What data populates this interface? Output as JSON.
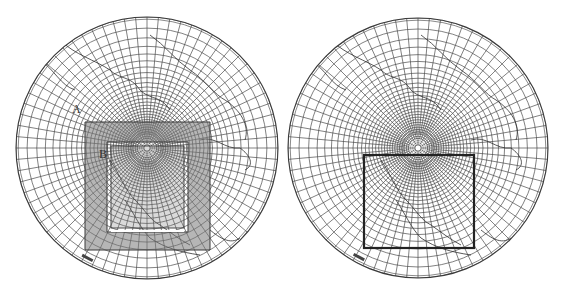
{
  "figure": {
    "panels": [
      {
        "id": "left",
        "projection": "polar-stereographic",
        "center": [
          147,
          148
        ],
        "radius": 131,
        "domain_style": "nested-shaded-frame",
        "outer_box": [
          85,
          122,
          210,
          250
        ],
        "inner_box": [
          107,
          142,
          188,
          232
        ],
        "labels": [
          {
            "text": "A",
            "x": 72,
            "y": 113
          },
          {
            "text": "B",
            "x": 99,
            "y": 158
          }
        ]
      },
      {
        "id": "right",
        "projection": "polar-stereographic",
        "center": [
          418,
          148
        ],
        "radius": 130,
        "domain_style": "single-box",
        "outer_box": [
          364,
          155,
          474,
          248
        ],
        "labels": []
      }
    ],
    "colors": {
      "line": "#3a3a3a",
      "grid": "#4a4a4a",
      "shade": "#7a7a7a",
      "background": "#ffffff"
    }
  }
}
